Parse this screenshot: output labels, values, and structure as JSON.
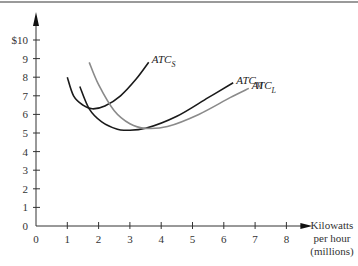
{
  "chart_data": {
    "type": "line",
    "title": "",
    "xlabel": "Kilowatts per hour (millions)",
    "xlabel_lines": [
      "Kilowatts",
      "per hour",
      "(millions)"
    ],
    "ylabel": "",
    "xlim": [
      0,
      8
    ],
    "ylim": [
      0,
      10
    ],
    "x_ticks": [
      "0",
      "1",
      "2",
      "3",
      "4",
      "5",
      "6",
      "7",
      "8"
    ],
    "y_ticks": [
      "0",
      "1",
      "2",
      "3",
      "4",
      "5",
      "6",
      "7",
      "8",
      "9",
      "$10"
    ],
    "grid": false,
    "legend": "inline labels at curve ends",
    "series": [
      {
        "name": "ATC_S",
        "label": "ATC",
        "subscript": "S",
        "color": "#1a1a1a",
        "points": [
          [
            1.0,
            8.0
          ],
          [
            1.2,
            7.0
          ],
          [
            1.5,
            6.5
          ],
          [
            1.8,
            6.3
          ],
          [
            2.2,
            6.45
          ],
          [
            2.7,
            7.0
          ],
          [
            3.2,
            7.9
          ],
          [
            3.6,
            8.8
          ]
        ]
      },
      {
        "name": "ATC_M",
        "label": "ATC",
        "subscript": "M",
        "color": "#1a1a1a",
        "points": [
          [
            1.4,
            7.5
          ],
          [
            1.7,
            6.3
          ],
          [
            2.1,
            5.6
          ],
          [
            2.6,
            5.2
          ],
          [
            2.9,
            5.15
          ],
          [
            3.5,
            5.25
          ],
          [
            4.5,
            5.9
          ],
          [
            5.5,
            6.9
          ],
          [
            6.3,
            7.7
          ]
        ]
      },
      {
        "name": "ATC_L",
        "label": "ATC",
        "subscript": "L",
        "color": "#8a8a8a",
        "points": [
          [
            1.7,
            8.8
          ],
          [
            2.0,
            7.6
          ],
          [
            2.5,
            6.2
          ],
          [
            3.0,
            5.5
          ],
          [
            3.5,
            5.25
          ],
          [
            4.2,
            5.35
          ],
          [
            5.2,
            6.0
          ],
          [
            6.2,
            6.9
          ],
          [
            6.8,
            7.4
          ]
        ]
      }
    ]
  }
}
